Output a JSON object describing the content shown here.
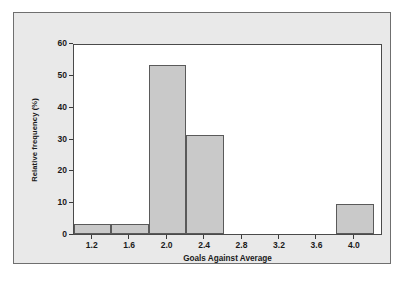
{
  "chart_data": {
    "type": "bar",
    "title": "",
    "xlabel": "Goals Against Average",
    "ylabel": "Relative frequency (%)",
    "xlim": [
      1.0,
      4.3
    ],
    "ylim": [
      0,
      60
    ],
    "grid": false,
    "legend": null,
    "bin_width": 0.4,
    "x_ticks": [
      "1.2",
      "1.6",
      "2.0",
      "2.4",
      "2.8",
      "3.2",
      "3.6",
      "4.0"
    ],
    "x_tick_values": [
      1.2,
      1.6,
      2.0,
      2.4,
      2.8,
      3.2,
      3.6,
      4.0
    ],
    "y_ticks": [
      "0",
      "10",
      "20",
      "30",
      "40",
      "50",
      "60"
    ],
    "y_tick_values": [
      0,
      10,
      20,
      30,
      40,
      50,
      60
    ],
    "bins": [
      {
        "label": "1.0-1.4",
        "start": 1.0,
        "end": 1.4,
        "value": 3.0
      },
      {
        "label": "1.4-1.8",
        "start": 1.4,
        "end": 1.8,
        "value": 3.0
      },
      {
        "label": "1.8-2.2",
        "start": 1.8,
        "end": 2.2,
        "value": 53.0
      },
      {
        "label": "2.2-2.6",
        "start": 2.2,
        "end": 2.6,
        "value": 31.0
      },
      {
        "label": "3.8-4.2",
        "start": 3.8,
        "end": 4.2,
        "value": 9.5
      }
    ],
    "categories": [
      "1.0-1.4",
      "1.4-1.8",
      "1.8-2.2",
      "2.2-2.6",
      "3.8-4.2"
    ],
    "values": [
      3.0,
      3.0,
      53.0,
      31.0,
      9.5
    ],
    "colors": {
      "bar_fill": "#c9c9c9",
      "bar_edge": "#5a5a5a",
      "plot_background": "#ffffff",
      "figure_background": "#e9e9e9",
      "axis": "#4a4a4a",
      "text": "#1a1a1a"
    }
  }
}
